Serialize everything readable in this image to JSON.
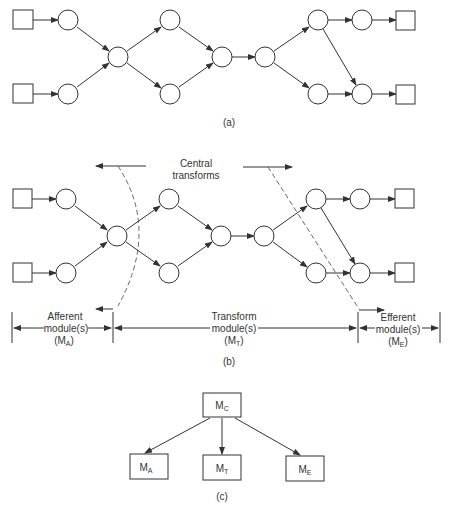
{
  "diagram_a": {
    "caption": "(a)"
  },
  "diagram_b": {
    "caption": "(b)",
    "central_label_line1": "Central",
    "central_label_line2": "transforms",
    "sections": [
      {
        "line1": "Afferent",
        "line2": "module(s)",
        "line3_main": "(M",
        "line3_sub": "A",
        "line3_end": ")"
      },
      {
        "line1": "Transform",
        "line2": "module(s)",
        "line3_main": "(M",
        "line3_sub": "T",
        "line3_end": ")"
      },
      {
        "line1": "Efferent",
        "line2": "module(s)",
        "line3_main": "(M",
        "line3_sub": "E",
        "line3_end": ")"
      }
    ]
  },
  "diagram_c": {
    "caption": "(c)",
    "root": {
      "main": "M",
      "sub": "C"
    },
    "children": [
      {
        "main": "M",
        "sub": "A"
      },
      {
        "main": "M",
        "sub": "T"
      },
      {
        "main": "M",
        "sub": "E"
      }
    ]
  },
  "colors": {
    "ink": "#333333",
    "background": "#ffffff"
  }
}
